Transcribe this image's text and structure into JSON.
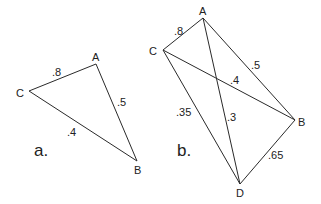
{
  "figures": [
    {
      "id": "a",
      "caption": "a.",
      "caption_pos": [
        34,
        156
      ],
      "vertices": [
        {
          "name": "A",
          "x": 96,
          "y": 64,
          "label_x": 92,
          "label_y": 61
        },
        {
          "name": "B",
          "x": 137,
          "y": 161,
          "label_x": 134,
          "label_y": 174
        },
        {
          "name": "C",
          "x": 29,
          "y": 91,
          "label_x": 16,
          "label_y": 97
        }
      ],
      "edges": [
        {
          "from": "C",
          "to": "A",
          "weight": ".8",
          "label_x": 52,
          "label_y": 76
        },
        {
          "from": "A",
          "to": "B",
          "weight": ".5",
          "label_x": 117,
          "label_y": 106
        },
        {
          "from": "C",
          "to": "B",
          "weight": ".4",
          "label_x": 67,
          "label_y": 136
        }
      ]
    },
    {
      "id": "b",
      "caption": "b.",
      "caption_pos": [
        177,
        156
      ],
      "vertices": [
        {
          "name": "A",
          "x": 203,
          "y": 18,
          "label_x": 199,
          "label_y": 15
        },
        {
          "name": "B",
          "x": 295,
          "y": 120,
          "label_x": 298,
          "label_y": 126
        },
        {
          "name": "C",
          "x": 163,
          "y": 50,
          "label_x": 149,
          "label_y": 55
        },
        {
          "name": "D",
          "x": 240,
          "y": 184,
          "label_x": 236,
          "label_y": 197
        }
      ],
      "edges": [
        {
          "from": "C",
          "to": "A",
          "weight": ".8",
          "label_x": 174,
          "label_y": 35
        },
        {
          "from": "A",
          "to": "B",
          "weight": ".5",
          "label_x": 251,
          "label_y": 69
        },
        {
          "from": "C",
          "to": "B",
          "weight": ".4",
          "label_x": 230,
          "label_y": 84
        },
        {
          "from": "C",
          "to": "D",
          "weight": ".35",
          "label_x": 176,
          "label_y": 116
        },
        {
          "from": "A",
          "to": "D",
          "weight": ".3",
          "label_x": 227,
          "label_y": 121
        },
        {
          "from": "B",
          "to": "D",
          "weight": ".65",
          "label_x": 268,
          "label_y": 159
        }
      ]
    }
  ]
}
